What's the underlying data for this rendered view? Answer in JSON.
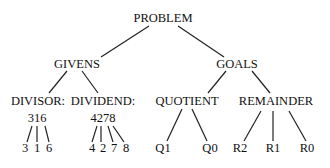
{
  "diagram": {
    "type": "tree",
    "nodes": [
      {
        "id": "problem",
        "label": "PROBLEM",
        "x": 163,
        "y": 22
      },
      {
        "id": "givens",
        "label": "GIVENS",
        "x": 77,
        "y": 68
      },
      {
        "id": "goals",
        "label": "GOALS",
        "x": 237,
        "y": 68
      },
      {
        "id": "divisor",
        "label": "DIVISOR:",
        "x": 38,
        "y": 105
      },
      {
        "id": "divisor_v",
        "label": "316",
        "x": 37,
        "y": 122
      },
      {
        "id": "dividend",
        "label": "DIVIDEND:",
        "x": 103,
        "y": 105
      },
      {
        "id": "dividend_v",
        "label": "4278",
        "x": 103,
        "y": 122
      },
      {
        "id": "quotient",
        "label": "QUOTIENT",
        "x": 187,
        "y": 105
      },
      {
        "id": "remainder",
        "label": "REMAINDER",
        "x": 276,
        "y": 105
      },
      {
        "id": "d3",
        "label": "3",
        "x": 25,
        "y": 152
      },
      {
        "id": "d1",
        "label": "1",
        "x": 37,
        "y": 152
      },
      {
        "id": "d6",
        "label": "6",
        "x": 49,
        "y": 152
      },
      {
        "id": "n4",
        "label": "4",
        "x": 92,
        "y": 152
      },
      {
        "id": "n2",
        "label": "2",
        "x": 103,
        "y": 152
      },
      {
        "id": "n7",
        "label": "7",
        "x": 114,
        "y": 152
      },
      {
        "id": "n8",
        "label": "8",
        "x": 126,
        "y": 152
      },
      {
        "id": "q1",
        "label": "Q1",
        "x": 163,
        "y": 152
      },
      {
        "id": "q0",
        "label": "Q0",
        "x": 210,
        "y": 152
      },
      {
        "id": "r2",
        "label": "R2",
        "x": 240,
        "y": 152
      },
      {
        "id": "r1",
        "label": "R1",
        "x": 273,
        "y": 152
      },
      {
        "id": "r0",
        "label": "R0",
        "x": 307,
        "y": 152
      }
    ],
    "edges": [
      {
        "from": "problem",
        "to": "givens",
        "x1": 149,
        "y1": 26,
        "x2": 101,
        "y2": 57
      },
      {
        "from": "problem",
        "to": "goals",
        "x1": 178,
        "y1": 26,
        "x2": 224,
        "y2": 57
      },
      {
        "from": "givens",
        "to": "divisor",
        "x1": 67,
        "y1": 71,
        "x2": 49,
        "y2": 93
      },
      {
        "from": "givens",
        "to": "dividend",
        "x1": 82,
        "y1": 71,
        "x2": 98,
        "y2": 93
      },
      {
        "from": "goals",
        "to": "quotient",
        "x1": 226,
        "y1": 71,
        "x2": 208,
        "y2": 93
      },
      {
        "from": "goals",
        "to": "remainder",
        "x1": 252,
        "y1": 71,
        "x2": 270,
        "y2": 93
      },
      {
        "from": "divisor_v",
        "to": "d3",
        "x1": 32,
        "y1": 126,
        "x2": 27,
        "y2": 142
      },
      {
        "from": "divisor_v",
        "to": "d1",
        "x1": 37,
        "y1": 126,
        "x2": 37,
        "y2": 142
      },
      {
        "from": "divisor_v",
        "to": "d6",
        "x1": 45,
        "y1": 126,
        "x2": 49,
        "y2": 142
      },
      {
        "from": "dividend_v",
        "to": "n4",
        "x1": 97,
        "y1": 126,
        "x2": 92,
        "y2": 142
      },
      {
        "from": "dividend_v",
        "to": "n2",
        "x1": 101,
        "y1": 126,
        "x2": 101,
        "y2": 142
      },
      {
        "from": "dividend_v",
        "to": "n7",
        "x1": 108,
        "y1": 126,
        "x2": 113,
        "y2": 142
      },
      {
        "from": "dividend_v",
        "to": "n8",
        "x1": 113,
        "y1": 126,
        "x2": 124,
        "y2": 142
      },
      {
        "from": "quotient",
        "to": "q1",
        "x1": 182,
        "y1": 109,
        "x2": 167,
        "y2": 141
      },
      {
        "from": "quotient",
        "to": "q0",
        "x1": 192,
        "y1": 109,
        "x2": 207,
        "y2": 141
      },
      {
        "from": "remainder",
        "to": "r2",
        "x1": 261,
        "y1": 111,
        "x2": 244,
        "y2": 141
      },
      {
        "from": "remainder",
        "to": "r1",
        "x1": 273,
        "y1": 111,
        "x2": 273,
        "y2": 141
      },
      {
        "from": "remainder",
        "to": "r0",
        "x1": 289,
        "y1": 111,
        "x2": 306,
        "y2": 141
      }
    ]
  }
}
